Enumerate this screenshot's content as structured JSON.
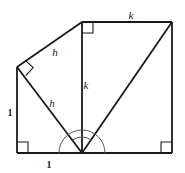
{
  "figure": {
    "type": "geometry-diagram",
    "stroke_color": "#1a1a1a",
    "background_color": "#ffffff",
    "labels": [
      {
        "text": "h",
        "x": 55,
        "y": 52,
        "style": "italic",
        "name": "label-h-upper"
      },
      {
        "text": "h",
        "x": 52,
        "y": 103,
        "style": "italic",
        "name": "label-h-lower"
      },
      {
        "text": "k",
        "x": 86,
        "y": 85,
        "style": "italic",
        "name": "label-k-vertical"
      },
      {
        "text": "k",
        "x": 131,
        "y": 15,
        "style": "italic",
        "name": "label-k-top"
      },
      {
        "text": "1",
        "x": 10,
        "y": 113,
        "style": "upright",
        "name": "label-one-left"
      },
      {
        "text": "1",
        "x": 49,
        "y": 165,
        "style": "upright",
        "name": "label-one-bottom"
      }
    ],
    "vertices": {
      "bottom_left": {
        "x": 17,
        "y": 153
      },
      "left": {
        "x": 17,
        "y": 67
      },
      "top_middle": {
        "x": 82,
        "y": 22
      },
      "top_right": {
        "x": 172,
        "y": 22
      },
      "bottom_right": {
        "x": 172,
        "y": 153
      },
      "apex": {
        "x": 82,
        "y": 153
      }
    },
    "segments": [
      {
        "name": "left-edge",
        "from": "left",
        "to": "bottom_left",
        "width": 1.8
      },
      {
        "name": "bottom-edge",
        "from": "bottom_left",
        "to": "bottom_right",
        "width": 1.8
      },
      {
        "name": "top-edge",
        "from": "top_middle",
        "to": "top_right",
        "width": 1.8
      },
      {
        "name": "right-edge",
        "from": "top_right",
        "to": "bottom_right",
        "width": 1.8
      },
      {
        "name": "vertical-k-segment",
        "from": "top_middle",
        "to": "apex",
        "width": 1.8
      },
      {
        "name": "hypotenuse-h-upper",
        "from": "left",
        "to": "top_middle",
        "width": 1.8
      },
      {
        "name": "hypotenuse-h-lower",
        "from": "left",
        "to": "apex",
        "width": 1.8
      },
      {
        "name": "diagonal-apex-topright",
        "from": "apex",
        "to": "top_right",
        "width": 1.8
      }
    ],
    "right_angle_markers": [
      {
        "name": "right-angle-bottom-left",
        "x": 17,
        "y": 153,
        "rotation": 0,
        "size": 11
      },
      {
        "name": "right-angle-bottom-right",
        "x": 172,
        "y": 153,
        "rotation": 90,
        "size": 11
      },
      {
        "name": "right-angle-top-middle",
        "x": 82,
        "y": 22,
        "rotation": 270,
        "size": 11
      },
      {
        "name": "right-angle-left-vertex",
        "x": 17,
        "y": 67,
        "rotation": 35,
        "size": 11
      }
    ],
    "angle_arcs": [
      {
        "name": "angle-arc-outer",
        "cx": 82,
        "cy": 153,
        "radius": 23,
        "start_deg": 0,
        "end_deg": 180
      },
      {
        "name": "angle-arc-inner",
        "cx": 82,
        "cy": 153,
        "radius": 16,
        "start_deg": 55,
        "end_deg": 125
      }
    ]
  }
}
